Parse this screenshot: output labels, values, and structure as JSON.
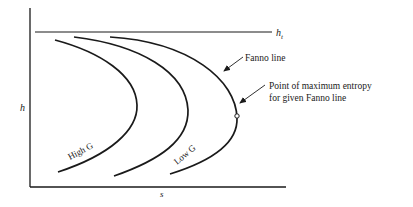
{
  "diagram": {
    "axes": {
      "y_label": "h",
      "x_label": "s"
    },
    "stagnation_line": {
      "label_main": "h",
      "label_sub": "t"
    },
    "curves": [
      {
        "name": "high-g-fanno-line",
        "label": "High G"
      },
      {
        "name": "middle-fanno-line",
        "label": ""
      },
      {
        "name": "low-g-fanno-line",
        "label": "Low G"
      }
    ],
    "annotations": {
      "fanno_line": "Fanno line",
      "max_entropy_line1": "Point of maximum entropy",
      "max_entropy_line2": "for given Fanno line"
    },
    "colors": {
      "ink": "#1a1a1a",
      "background": "#ffffff"
    }
  }
}
